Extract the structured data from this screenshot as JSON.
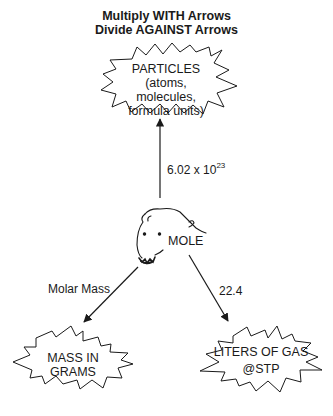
{
  "title": {
    "line1": "Multiply WITH Arrows",
    "line2": "Divide AGAINST Arrows"
  },
  "nodes": {
    "particles": {
      "line1": "PARTICLES",
      "line2": "(atoms, molecules,",
      "line3": "formula units)"
    },
    "mole": {
      "label": "MOLE",
      "icon": "mole-animal-icon"
    },
    "mass": {
      "label": "MASS IN GRAMS"
    },
    "gas": {
      "line1": "LITERS OF GAS",
      "line2": "@STP"
    }
  },
  "edges": {
    "mole_to_particles": {
      "base": "6.02 x 10",
      "exponent": "23"
    },
    "mole_to_mass": {
      "label": "Molar Mass"
    },
    "mole_to_gas": {
      "label": "22.4"
    }
  },
  "colors": {
    "stroke": "#1a1a1a",
    "background": "#ffffff"
  }
}
